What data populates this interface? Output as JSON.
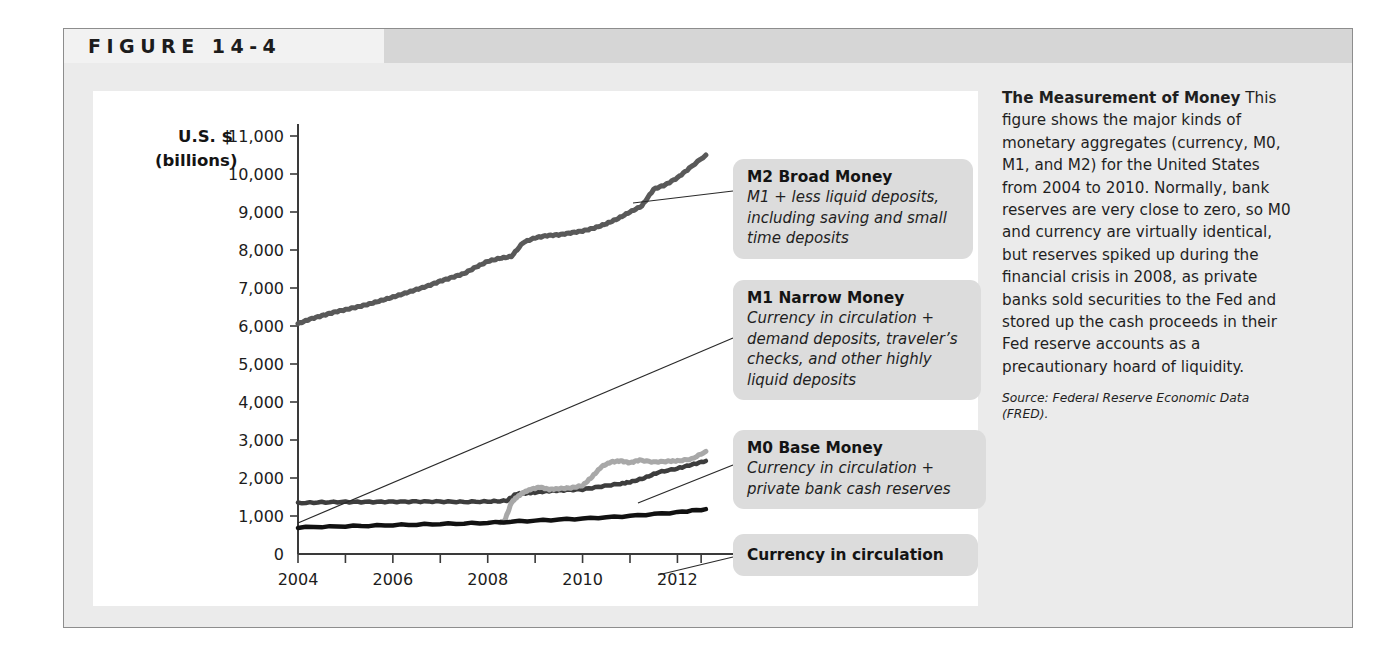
{
  "figure": {
    "number_label": "FIGURE  14-4"
  },
  "chart_data": {
    "type": "line",
    "title": "",
    "xlabel": "",
    "ylabel": "U.S. $ (billions)",
    "ylabel_line1": "U.S. $",
    "ylabel_line2": "(billions)",
    "xlim": [
      2004,
      2012.75
    ],
    "ylim": [
      0,
      11000
    ],
    "grid": false,
    "legend_position": "callouts-right",
    "y_ticks": [
      0,
      1000,
      2000,
      3000,
      4000,
      5000,
      6000,
      7000,
      8000,
      9000,
      10000,
      11000
    ],
    "y_tick_labels": [
      "0",
      "1,000",
      "2,000",
      "3,000",
      "4,000",
      "5,000",
      "6,000",
      "7,000",
      "8,000",
      "9,000",
      "10,000",
      "11,000"
    ],
    "x_ticks": [
      2004,
      2005,
      2006,
      2007,
      2008,
      2009,
      2010,
      2011,
      2012
    ],
    "x_tick_labels": [
      "2004",
      "",
      "2006",
      "",
      "2008",
      "",
      "2010",
      "",
      "2012"
    ],
    "x_labeled_ticks": [
      2004,
      2006,
      2008,
      2010,
      2012
    ],
    "series": [
      {
        "name": "M2 Broad Money",
        "color": "#595959",
        "x": [
          2004.0,
          2004.25,
          2004.5,
          2004.75,
          2005.0,
          2005.25,
          2005.5,
          2005.75,
          2006.0,
          2006.25,
          2006.5,
          2006.75,
          2007.0,
          2007.25,
          2007.5,
          2007.75,
          2008.0,
          2008.25,
          2008.5,
          2008.75,
          2009.0,
          2009.25,
          2009.5,
          2009.75,
          2010.0,
          2010.25,
          2010.5,
          2010.75,
          2011.0,
          2011.25,
          2011.5,
          2011.75,
          2012.0,
          2012.25,
          2012.6
        ],
        "values": [
          6060,
          6180,
          6270,
          6360,
          6430,
          6500,
          6580,
          6670,
          6760,
          6860,
          6960,
          7060,
          7180,
          7280,
          7380,
          7550,
          7700,
          7780,
          7830,
          8200,
          8320,
          8380,
          8400,
          8450,
          8500,
          8580,
          8690,
          8830,
          9000,
          9160,
          9600,
          9720,
          9900,
          10150,
          10500
        ]
      },
      {
        "name": "M1 Narrow Money",
        "color": "#3d3d3d",
        "x": [
          2004.0,
          2004.5,
          2005.0,
          2005.5,
          2006.0,
          2006.5,
          2007.0,
          2007.5,
          2008.0,
          2008.4,
          2008.6,
          2008.8,
          2009.0,
          2009.3,
          2009.6,
          2010.0,
          2010.4,
          2010.8,
          2011.0,
          2011.3,
          2011.6,
          2012.0,
          2012.3,
          2012.6
        ],
        "values": [
          1340,
          1360,
          1370,
          1370,
          1375,
          1380,
          1380,
          1370,
          1380,
          1400,
          1580,
          1600,
          1620,
          1660,
          1680,
          1700,
          1780,
          1850,
          1890,
          2000,
          2150,
          2250,
          2350,
          2450
        ]
      },
      {
        "name": "M0 Base Money",
        "color": "#a8a8a8",
        "x": [
          2008.25,
          2008.35,
          2008.5,
          2008.6,
          2008.75,
          2008.9,
          2009.1,
          2009.3,
          2009.5,
          2009.75,
          2010.0,
          2010.2,
          2010.4,
          2010.6,
          2010.8,
          2011.0,
          2011.2,
          2011.5,
          2011.8,
          2012.0,
          2012.3,
          2012.6
        ],
        "values": [
          830,
          850,
          1350,
          1480,
          1620,
          1700,
          1760,
          1700,
          1720,
          1740,
          1800,
          2030,
          2300,
          2420,
          2450,
          2400,
          2470,
          2420,
          2440,
          2450,
          2500,
          2700
        ]
      },
      {
        "name": "Currency in circulation",
        "color": "#111111",
        "x": [
          2004.0,
          2005.0,
          2006.0,
          2007.0,
          2008.0,
          2009.0,
          2010.0,
          2011.0,
          2012.0,
          2012.6
        ],
        "values": [
          700,
          730,
          760,
          790,
          820,
          880,
          930,
          1000,
          1100,
          1180
        ]
      }
    ]
  },
  "callouts": {
    "m2": {
      "title": "M2 Broad Money",
      "desc": "M1 + less liquid deposits, including saving and small time deposits"
    },
    "m1": {
      "title": "M1 Narrow Money",
      "desc": "Currency in circulation + demand deposits, traveler’s checks, and other highly liquid deposits"
    },
    "m0": {
      "title": "M0 Base Money",
      "desc": "Currency in circulation + private bank cash reserves"
    },
    "currency": {
      "title": "Currency in circulation",
      "desc": ""
    }
  },
  "caption": {
    "lead": "The Measurement of Money",
    "body": " This figure shows the major kinds of monetary aggregates (currency, M0, M1, and M2) for the United States from 2004 to 2010. Normally, bank reserves are very close to zero, so M0 and currency are virtually identical, but reserves spiked up during the financial crisis in 2008, as private banks sold securities to the Fed and stored up the cash proceeds in their Fed reserve accounts as a precautionary hoard of liquidity.",
    "source": "Source: Federal Reserve Economic Data (FRED)."
  },
  "colors": {
    "m2": "#595959",
    "m1": "#3d3d3d",
    "m0": "#a8a8a8",
    "currency": "#111111",
    "panel_bg": "#ebebeb",
    "chart_bg": "#ffffff",
    "callout_bg": "#dcdcdc"
  }
}
